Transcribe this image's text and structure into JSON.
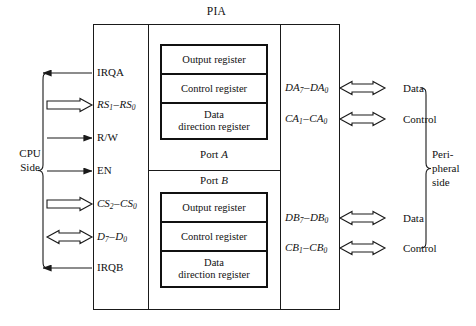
{
  "diagram": {
    "title": "PIA",
    "cpu_side": {
      "brace_label_lines": [
        "CPU",
        "Side"
      ],
      "signals": [
        {
          "id": "irqa",
          "label": "IRQA",
          "arrow": "single-left",
          "y": 73
        },
        {
          "id": "rs",
          "label": "RS1-RS0",
          "arrow": "bus-right",
          "y": 105
        },
        {
          "id": "rw",
          "label": "R/W",
          "arrow": "single-right",
          "y": 138
        },
        {
          "id": "en",
          "label": "EN",
          "arrow": "single-right",
          "y": 171
        },
        {
          "id": "cs",
          "label": "CS2-CS0",
          "arrow": "bus-right",
          "y": 204
        },
        {
          "id": "d",
          "label": "D7-D0",
          "arrow": "bus-bidir",
          "y": 237
        },
        {
          "id": "irqb",
          "label": "IRQB",
          "arrow": "single-left",
          "y": 268
        }
      ]
    },
    "peripheral_side": {
      "brace_label_lines": [
        "Peri-",
        "pheral",
        "side"
      ],
      "signals": [
        {
          "id": "da",
          "label": "DA7-DA0",
          "far_label": "Data",
          "arrow": "bus-bidir",
          "y": 88
        },
        {
          "id": "ca",
          "label": "CA1-CA0",
          "far_label": "Control",
          "arrow": "bus-bidir",
          "y": 119
        },
        {
          "id": "db",
          "label": "DB7-DB0",
          "far_label": "Data",
          "arrow": "bus-bidir",
          "y": 218
        },
        {
          "id": "cb",
          "label": "CB1-CB0",
          "far_label": "Control",
          "arrow": "bus-bidir",
          "y": 248
        }
      ]
    },
    "ports": [
      {
        "id": "port-a",
        "label_prefix": "Port ",
        "label_letter": "A",
        "label_position": "below",
        "registers": [
          "Output register",
          "Control register",
          "Data direction register"
        ]
      },
      {
        "id": "port-b",
        "label_prefix": "Port ",
        "label_letter": "B",
        "label_position": "above",
        "registers": [
          "Output register",
          "Control register",
          "Data direction register"
        ]
      }
    ],
    "register_labels": {
      "output": "Output register",
      "control": "Control register",
      "data_direction_line1": "Data",
      "data_direction_line2": "direction register"
    },
    "colors": {
      "line": "#1a1a1a",
      "register_border": "#111111",
      "background": "#ffffff",
      "text": "#111111"
    }
  }
}
